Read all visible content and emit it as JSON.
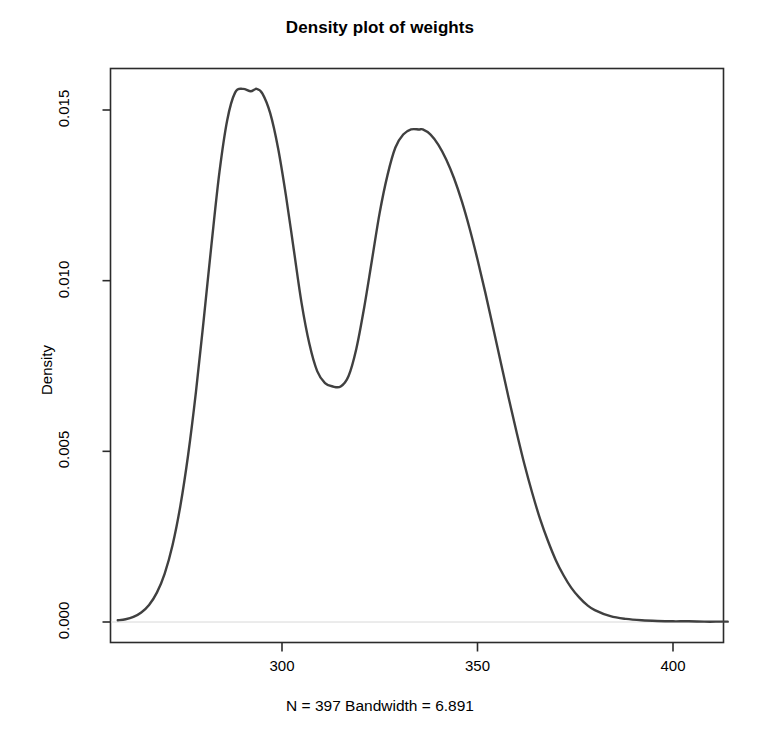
{
  "chart_data": {
    "type": "line",
    "title": "Density plot of weights",
    "subtitle": "",
    "xlabel": "",
    "ylabel": "Density",
    "caption": "N = 397   Bandwidth = 6.891",
    "n": 397,
    "bandwidth": 6.891,
    "grid": false,
    "legend": null,
    "box": true,
    "line_color": "#404040",
    "line_width": 2.4,
    "baseline_color": "#d8d8d8",
    "xlim": [
      258,
      414
    ],
    "ylim": [
      0.0,
      0.0163
    ],
    "xticks": [
      300,
      350,
      400
    ],
    "xtick_labels": [
      "300",
      "350",
      "400"
    ],
    "yticks": [
      0.0,
      0.005,
      0.01,
      0.015
    ],
    "ytick_labels": [
      "0.000",
      "0.005",
      "0.010",
      "0.015"
    ],
    "features": {
      "peak1": {
        "x": 293.5,
        "y": 0.01562
      },
      "valley": {
        "x": 315.0,
        "y": 0.0069
      },
      "peak2": {
        "x": 336.0,
        "y": 0.01443
      },
      "left_tail_x": 260.0,
      "right_tail_x": 412.0
    },
    "series": [
      {
        "name": "density",
        "x": [
          258.0,
          260.0,
          262.0,
          264.0,
          266.0,
          268.0,
          270.0,
          272.0,
          274.0,
          276.0,
          278.0,
          280.0,
          282.0,
          284.0,
          286.0,
          288.0,
          290.0,
          292.0,
          293.5,
          295.0,
          297.0,
          299.0,
          301.0,
          303.0,
          305.0,
          307.0,
          309.0,
          311.0,
          313.0,
          315.0,
          317.0,
          319.0,
          321.0,
          323.0,
          325.0,
          327.0,
          329.0,
          331.0,
          333.0,
          335.0,
          336.0,
          338.0,
          340.0,
          342.0,
          344.0,
          346.0,
          348.0,
          350.0,
          352.0,
          354.0,
          356.0,
          358.0,
          360.0,
          362.0,
          364.0,
          366.0,
          368.0,
          370.0,
          372.0,
          374.0,
          376.0,
          378.0,
          380.0,
          384.0,
          388.0,
          392.0,
          396.0,
          400.0,
          404.0,
          408.0,
          412.0,
          414.0
        ],
        "y": [
          5e-05,
          8e-05,
          0.00015,
          0.00028,
          0.0005,
          0.00086,
          0.00142,
          0.00225,
          0.0034,
          0.0049,
          0.00675,
          0.00888,
          0.0111,
          0.01318,
          0.01471,
          0.01551,
          0.01562,
          0.01555,
          0.01562,
          0.01548,
          0.0149,
          0.01388,
          0.0125,
          0.01092,
          0.00935,
          0.00815,
          0.00735,
          0.007,
          0.0069,
          0.0069,
          0.0072,
          0.008,
          0.0092,
          0.0106,
          0.012,
          0.0131,
          0.0139,
          0.01428,
          0.01443,
          0.01443,
          0.01443,
          0.01428,
          0.01398,
          0.01355,
          0.013,
          0.01232,
          0.01152,
          0.01062,
          0.00965,
          0.00862,
          0.00758,
          0.00655,
          0.00556,
          0.00462,
          0.00378,
          0.00302,
          0.00238,
          0.00182,
          0.00137,
          0.001,
          0.00072,
          0.0005,
          0.00035,
          0.00017,
          9e-05,
          5e-05,
          3e-05,
          2e-05,
          2e-05,
          1e-05,
          1e-05,
          1e-05
        ]
      }
    ]
  },
  "axes": {
    "ylabel": "Density",
    "ytick_labels": [
      "0.000",
      "0.005",
      "0.010",
      "0.015"
    ],
    "xtick_labels": [
      "300",
      "350",
      "400"
    ]
  },
  "title": "Density plot of weights",
  "caption": "N = 397   Bandwidth = 6.891"
}
